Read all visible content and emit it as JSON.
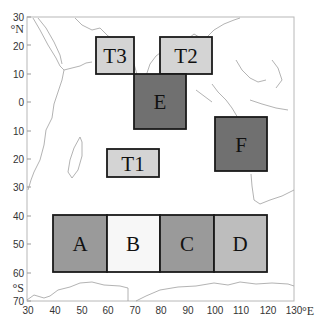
{
  "map": {
    "type": "region-map",
    "projection": "equirectangular",
    "x_axis": {
      "ticks": [
        30,
        40,
        50,
        60,
        70,
        80,
        90,
        100,
        110,
        120,
        130
      ],
      "unit": "°E",
      "range": [
        30,
        130
      ]
    },
    "y_axis": {
      "ticks": [
        30,
        20,
        10,
        0,
        10,
        20,
        30,
        40,
        50,
        60,
        70
      ],
      "values": [
        30,
        20,
        10,
        0,
        -10,
        -20,
        -30,
        -40,
        -50,
        -60,
        -70
      ],
      "unit_north": "°N",
      "unit_south": "°S",
      "range": [
        -70,
        30
      ]
    },
    "regions": [
      {
        "label": "T3",
        "lon": [
          55.5,
          70
        ],
        "lat": [
          10,
          22
        ],
        "fill": "#d4d4d4"
      },
      {
        "label": "T2",
        "lon": [
          79,
          97
        ],
        "lat": [
          10,
          22
        ],
        "fill": "#d4d4d4"
      },
      {
        "label": "E",
        "lon": [
          70,
          90
        ],
        "lat": [
          -9,
          10
        ],
        "fill": "#707070"
      },
      {
        "label": "F",
        "lon": [
          100,
          120
        ],
        "lat": [
          -24,
          -5
        ],
        "fill": "#707070"
      },
      {
        "label": "T1",
        "lon": [
          64,
          80
        ],
        "lat": [
          -26,
          -17
        ],
        "fill": "#d4d4d4"
      },
      {
        "label": "A",
        "lon": [
          40,
          60
        ],
        "lat": [
          -60,
          -40
        ],
        "fill": "#9a9a9a"
      },
      {
        "label": "B",
        "lon": [
          60,
          80
        ],
        "lat": [
          -60,
          -40
        ],
        "fill": "#f7f7f7"
      },
      {
        "label": "C",
        "lon": [
          80,
          100
        ],
        "lat": [
          -60,
          -40
        ],
        "fill": "#9a9a9a"
      },
      {
        "label": "D",
        "lon": [
          100,
          120
        ],
        "lat": [
          -60,
          -40
        ],
        "fill": "#bdbdbd"
      }
    ],
    "colors": {
      "coastline": "#9a9a9a",
      "axis": "#b0b0b0",
      "box_border": "#1a1a1a"
    }
  }
}
